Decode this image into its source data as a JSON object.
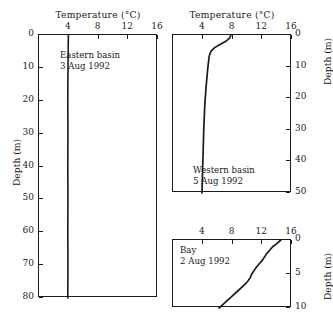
{
  "figure": {
    "axis_title": "Temperature (°C)",
    "depth_axis_label": "Depth (m)"
  },
  "panels": {
    "eastern": {
      "name": "Eastern basin",
      "date": "3 Aug 1992",
      "x_ticks": [
        "4",
        "8",
        "12",
        "16"
      ],
      "y_ticks": [
        "0",
        "10",
        "20",
        "30",
        "40",
        "50",
        "60",
        "70",
        "80"
      ]
    },
    "western": {
      "name": "Western basin",
      "date": "5 Aug 1992",
      "x_ticks": [
        "4",
        "8",
        "12",
        "16"
      ],
      "y_ticks": [
        "0",
        "10",
        "20",
        "30",
        "40",
        "50"
      ]
    },
    "bay": {
      "name": "Bay",
      "date": "2 Aug 1992",
      "x_ticks": [
        "4",
        "8",
        "12",
        "16"
      ],
      "y_ticks": [
        "0",
        "5",
        "10"
      ]
    }
  },
  "chart_data": [
    {
      "type": "line",
      "title": "Eastern basin",
      "annotation": "Eastern basin\n3 Aug 1992",
      "xlabel": "Temperature (°C)",
      "ylabel": "Depth (m)",
      "xlim": [
        0,
        16
      ],
      "ylim": [
        80,
        0
      ],
      "y_axis_side": "left",
      "y_inverted": true,
      "grid": false,
      "legend": "none",
      "x_ticks": [
        4,
        8,
        12,
        16
      ],
      "y_ticks": [
        0,
        10,
        20,
        30,
        40,
        50,
        60,
        70,
        80
      ],
      "series": [
        {
          "name": "3 Aug 1992 profile",
          "x": [
            3.95,
            3.92,
            3.9,
            3.88,
            3.87,
            3.88,
            3.89,
            3.88,
            3.87,
            3.88,
            3.89,
            3.88,
            3.87,
            3.88,
            3.89,
            3.88,
            3.87
          ],
          "y": [
            0,
            5,
            10,
            15,
            20,
            25,
            30,
            35,
            40,
            45,
            50,
            55,
            60,
            65,
            70,
            75,
            80
          ]
        }
      ]
    },
    {
      "type": "line",
      "title": "Western basin",
      "annotation": "Western basin\n5 Aug 1992",
      "xlabel": "Temperature (°C)",
      "ylabel": "Depth (m)",
      "xlim": [
        0,
        16
      ],
      "ylim": [
        50,
        0
      ],
      "y_axis_side": "right",
      "y_inverted": true,
      "grid": false,
      "legend": "none",
      "x_ticks": [
        4,
        8,
        12,
        16
      ],
      "y_ticks": [
        0,
        10,
        20,
        30,
        40,
        50
      ],
      "series": [
        {
          "name": "5 Aug 1992 profile",
          "x": [
            7.8,
            7.6,
            7.1,
            6.3,
            5.6,
            5.15,
            4.95,
            4.85,
            4.8,
            4.75,
            4.7,
            4.62,
            4.5,
            4.4,
            4.3,
            4.22,
            4.15,
            4.1,
            4.05,
            4.0,
            3.95,
            3.9
          ],
          "y": [
            0,
            1,
            2,
            3,
            4,
            5,
            6,
            7,
            8,
            9,
            10,
            12,
            15,
            18,
            21,
            25,
            29,
            33,
            37,
            41,
            45,
            50
          ]
        }
      ]
    },
    {
      "type": "line",
      "title": "Bay",
      "annotation": "Bay\n2 Aug 1992",
      "xlabel": "Temperature (°C)",
      "ylabel": "Depth (m)",
      "xlim": [
        0,
        16
      ],
      "ylim": [
        10,
        0
      ],
      "y_axis_side": "right",
      "y_inverted": true,
      "grid": false,
      "legend": "none",
      "x_ticks": [
        4,
        8,
        12,
        16
      ],
      "y_ticks": [
        0,
        5,
        10
      ],
      "series": [
        {
          "name": "2 Aug 1992 profile",
          "x": [
            14.5,
            14.0,
            13.4,
            13.0,
            12.6,
            12.3,
            12.0,
            11.6,
            11.2,
            10.9,
            10.6,
            10.4,
            10.1,
            9.7,
            9.2,
            8.7,
            8.2,
            7.7,
            7.2,
            6.7,
            6.2
          ],
          "y": [
            0,
            0.5,
            1.0,
            1.5,
            2.0,
            2.5,
            3.0,
            3.5,
            4.0,
            4.5,
            5.0,
            5.5,
            6.0,
            6.5,
            7.0,
            7.5,
            8.0,
            8.5,
            9.0,
            9.5,
            10.0
          ]
        }
      ]
    }
  ]
}
